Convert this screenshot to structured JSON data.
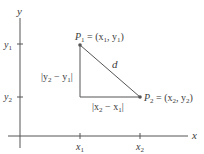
{
  "diagram": {
    "type": "distance-formula",
    "axes": {
      "x_label": "x",
      "y_label": "y"
    },
    "ticks": {
      "x": [
        {
          "label": "x",
          "sub": "1"
        },
        {
          "label": "x",
          "sub": "2"
        }
      ],
      "y": [
        {
          "label": "y",
          "sub": "1"
        },
        {
          "label": "y",
          "sub": "2"
        }
      ]
    },
    "points": [
      {
        "name": "P1",
        "label_main": "P",
        "label_sub": "1",
        "label_rest": " = (x",
        "coord1_sub": "1",
        "sep": ", y",
        "coord2_sub": "1",
        "close": ")"
      },
      {
        "name": "P2",
        "label_main": "P",
        "label_sub": "2",
        "label_rest": " = (x",
        "coord1_sub": "2",
        "sep": ", y",
        "coord2_sub": "2",
        "close": ")"
      }
    ],
    "hypotenuse_label": "d",
    "vertical_leg_label": {
      "pre": "|y",
      "s1": "2",
      "mid": " − y",
      "s2": "1",
      "post": "|"
    },
    "horizontal_leg_label": {
      "pre": "|x",
      "s1": "2",
      "mid": " − x",
      "s2": "1",
      "post": "|"
    },
    "colors": {
      "line": "#555555",
      "text": "#3a3a3a"
    }
  }
}
